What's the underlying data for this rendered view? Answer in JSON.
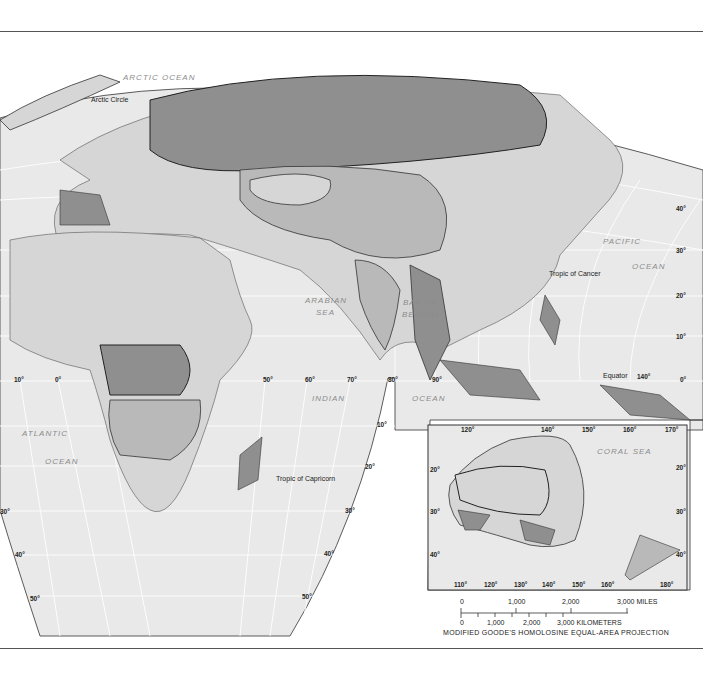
{
  "map": {
    "projection": "MODIFIED GOODE'S HOMOLOSINE EQUAL-AREA PROJECTION",
    "colors": {
      "ocean": "#e9e9e9",
      "background": "#ffffff",
      "land_light": "#d6d6d6",
      "land_medium": "#b9b9b9",
      "land_dark": "#8f8f8f",
      "border": "#555555",
      "grid": "#ffffff"
    },
    "ocean_labels": {
      "arctic": "ARCTIC OCEAN",
      "pacific_1": "PACIFIC",
      "pacific_2": "OCEAN",
      "arabian_1": "ARABIAN",
      "arabian_2": "SEA",
      "bengal_1": "BAY OF",
      "bengal_2": "BENGAL",
      "indian_1": "INDIAN",
      "indian_2": "OCEAN",
      "atlantic_1": "ATLANTIC",
      "atlantic_2": "OCEAN",
      "coral": "CORAL SEA"
    },
    "feature_labels": {
      "arctic_circle": "Arctic Circle",
      "tropic_cancer": "Tropic of Cancer",
      "tropic_capricorn": "Tropic of Capricorn",
      "equator": "Equator"
    },
    "longitude_labels": [
      "10°",
      "0°",
      "50°",
      "60°",
      "70°",
      "80°",
      "90°",
      "140°"
    ],
    "latitude_labels_right": [
      "40°",
      "30°",
      "20°",
      "10°",
      "0°"
    ],
    "latitude_labels_indian": [
      "10°",
      "20°",
      "30°",
      "40°",
      "50°"
    ],
    "latitude_labels_left": [
      "30°",
      "40°",
      "50°"
    ],
    "inset": {
      "top_longitudes": [
        "120°",
        "140°",
        "150°",
        "160°",
        "170°"
      ],
      "bottom_longitudes": [
        "110°",
        "120°",
        "130°",
        "140°",
        "150°",
        "160°",
        "180°"
      ],
      "left_latitudes": [
        "20°",
        "30°",
        "40°"
      ],
      "right_latitudes": [
        "20°",
        "30°",
        "40°"
      ]
    },
    "scale": {
      "miles_ticks": [
        "0",
        "1,000",
        "2,000",
        "3,000 MILES"
      ],
      "km_ticks": [
        "0",
        "1,000",
        "2,000",
        "3,000 KILOMETERS"
      ]
    }
  }
}
